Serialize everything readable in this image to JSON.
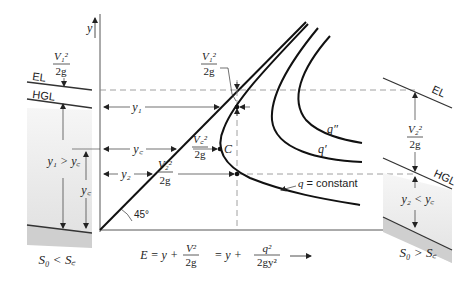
{
  "diagram": {
    "axis": {
      "y_label": "y",
      "x_label_equation": {
        "lhs": "E = y +",
        "term1_num": "V²",
        "term1_den": "2g",
        "mid": "= y +",
        "term2_num": "q²",
        "term2_den": "2gy²"
      },
      "angle_label": "45°"
    },
    "left_channel": {
      "el_label": "EL",
      "hgl_label": "HGL",
      "velocity_head_num": "V₁²",
      "velocity_head_den": "2g",
      "depth_relation": "y₁ > y꜀",
      "critical_depth": "y꜀",
      "slope_relation": "S₀ < S꜀"
    },
    "right_channel": {
      "el_label": "EL",
      "hgl_label": "HGL",
      "velocity_head_num": "V₂²",
      "velocity_head_den": "2g",
      "depth_relation": "y₂ < y꜀",
      "slope_relation": "S₀ > S꜀"
    },
    "depth_labels": {
      "y1": "y₁",
      "yc": "y꜀",
      "y2": "y₂"
    },
    "velocity_heads": {
      "v1_num": "V₁²",
      "v1_den": "2g",
      "vc_num": "V꜀²",
      "vc_den": "2g",
      "v2_num": "V₂²",
      "v2_den": "2g"
    },
    "critical_point": "C",
    "curves": {
      "q": "q = constant",
      "q_prime": "q′",
      "q_double_prime": "q″"
    },
    "colors": {
      "line": "#1a1a1a",
      "thin": "#444444",
      "dash": "#777777",
      "fill": "#e8e8e8",
      "fill_dark": "#cfcfcf"
    }
  }
}
